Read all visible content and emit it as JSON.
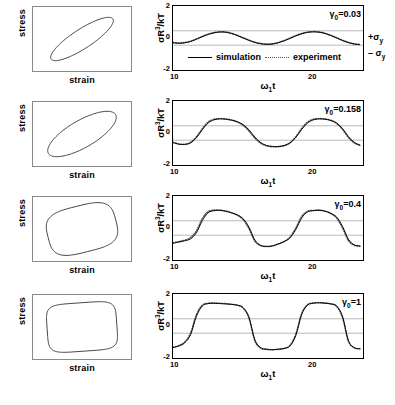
{
  "figure": {
    "rows": 4
  },
  "left_panels": {
    "xlabel": "strain",
    "ylabel": "stress",
    "shapes": [
      "narrow-tilted-ellipse",
      "wide-tilted-ellipse",
      "rounded-parallelogram",
      "rounded-rectangle"
    ]
  },
  "right_panels": {
    "ylabel_html": "σR<sup>3</sup>/kT",
    "xlabel_html": "ω<sub>1</sub>t",
    "yticks": [
      "2",
      "0",
      "-2"
    ],
    "xticks": [
      "10",
      "20"
    ],
    "sigma_plus": "+σ",
    "sigma_plus_sub": "y",
    "sigma_minus": "– σ",
    "sigma_minus_sub": "y",
    "legend": {
      "simulation": "simulation",
      "experiment": "experiment"
    }
  },
  "annotations": {
    "row1_gamma_pre": "γ",
    "row1_gamma_sub": "0",
    "row1_gamma_val": "=0.03",
    "row2_gamma_pre": "γ",
    "row2_gamma_sub": "0",
    "row2_gamma_val": "=0.158",
    "row3_gamma_pre": "γ",
    "row3_gamma_sub": "0",
    "row3_gamma_val": "=0.4",
    "row4_gamma_pre": "γ",
    "row4_gamma_sub": "0",
    "row4_gamma_val": "=1"
  },
  "chart_data": [
    {
      "type": "line",
      "panel": "row1-waveform",
      "title": "",
      "xlabel": "ω₁t",
      "ylabel": "σR³/kT",
      "xlim": [
        10,
        23
      ],
      "ylim": [
        -2,
        2
      ],
      "xticks": [
        10,
        20
      ],
      "yticks": [
        -2,
        0,
        2
      ],
      "grid": false,
      "gamma_0": 0.03,
      "reference_lines": [
        {
          "label": "+σy",
          "value": 0.45
        },
        {
          "label": "-σy",
          "value": -0.45
        }
      ],
      "legend": [
        "simulation",
        "experiment"
      ],
      "legend_position": "lower-left-inside",
      "series": [
        {
          "name": "simulation",
          "style": "solid",
          "x": [
            10.0,
            10.4,
            10.8,
            11.2,
            11.6,
            12.0,
            12.4,
            12.8,
            13.2,
            13.6,
            14.0,
            14.4,
            14.8,
            15.2,
            15.6,
            16.0,
            16.4,
            16.8,
            17.2,
            17.6,
            18.0,
            18.4,
            18.8,
            19.2,
            19.6,
            20.0,
            20.4,
            20.8,
            21.2,
            21.6,
            22.0,
            22.4,
            22.8
          ],
          "y": [
            -0.3,
            -0.33,
            -0.3,
            -0.22,
            -0.08,
            0.08,
            0.22,
            0.32,
            0.37,
            0.36,
            0.28,
            0.15,
            0.0,
            -0.15,
            -0.28,
            -0.36,
            -0.4,
            -0.38,
            -0.3,
            -0.18,
            -0.03,
            0.13,
            0.26,
            0.35,
            0.38,
            0.36,
            0.28,
            0.15,
            0.0,
            -0.16,
            -0.29,
            -0.38,
            -0.42
          ]
        },
        {
          "name": "experiment",
          "style": "dotted",
          "x": [
            10.0,
            10.4,
            10.8,
            11.2,
            11.6,
            12.0,
            12.4,
            12.8,
            13.2,
            13.6,
            14.0,
            14.4,
            14.8,
            15.2,
            15.6,
            16.0,
            16.4,
            16.8,
            17.2,
            17.6,
            18.0,
            18.4,
            18.8,
            19.2,
            19.6,
            20.0,
            20.4,
            20.8,
            21.2,
            21.6,
            22.0,
            22.4,
            22.8
          ],
          "y": [
            -0.28,
            -0.31,
            -0.28,
            -0.2,
            -0.06,
            0.1,
            0.24,
            0.34,
            0.39,
            0.38,
            0.3,
            0.17,
            0.02,
            -0.13,
            -0.26,
            -0.34,
            -0.38,
            -0.36,
            -0.28,
            -0.16,
            -0.01,
            0.15,
            0.28,
            0.37,
            0.4,
            0.38,
            0.3,
            0.17,
            0.02,
            -0.14,
            -0.27,
            -0.36,
            -0.4
          ]
        }
      ]
    },
    {
      "type": "line",
      "panel": "row2-waveform",
      "xlabel": "ω₁t",
      "ylabel": "σR³/kT",
      "xlim": [
        10,
        23
      ],
      "ylim": [
        -2,
        2
      ],
      "xticks": [
        10,
        20
      ],
      "yticks": [
        -2,
        0,
        2
      ],
      "gamma_0": 0.158,
      "reference_lines": [
        {
          "label": "+σy",
          "value": 0.45
        },
        {
          "label": "-σy",
          "value": -0.45
        }
      ],
      "series": [
        {
          "name": "simulation",
          "style": "solid",
          "x": [
            10.0,
            10.4,
            10.8,
            11.2,
            11.6,
            12.0,
            12.4,
            12.8,
            13.2,
            13.6,
            14.0,
            14.4,
            14.8,
            15.2,
            15.6,
            16.0,
            16.4,
            16.8,
            17.2,
            17.6,
            18.0,
            18.4,
            18.8,
            19.2,
            19.6,
            20.0,
            20.4,
            20.8,
            21.2,
            21.6,
            22.0,
            22.4,
            22.8
          ],
          "y": [
            -0.6,
            -0.7,
            -0.72,
            -0.62,
            -0.3,
            0.2,
            0.62,
            0.82,
            0.88,
            0.86,
            0.8,
            0.7,
            0.52,
            0.2,
            -0.25,
            -0.6,
            -0.78,
            -0.84,
            -0.84,
            -0.78,
            -0.62,
            -0.28,
            0.22,
            0.62,
            0.82,
            0.88,
            0.86,
            0.78,
            0.62,
            0.28,
            -0.22,
            -0.58,
            -0.76
          ]
        },
        {
          "name": "experiment",
          "style": "dotted",
          "x": [
            10.0,
            10.4,
            10.8,
            11.2,
            11.6,
            12.0,
            12.4,
            12.8,
            13.2,
            13.6,
            14.0,
            14.4,
            14.8,
            15.2,
            15.6,
            16.0,
            16.4,
            16.8,
            17.2,
            17.6,
            18.0,
            18.4,
            18.8,
            19.2,
            19.6,
            20.0,
            20.4,
            20.8,
            21.2,
            21.6,
            22.0,
            22.4,
            22.8
          ],
          "y": [
            -0.58,
            -0.68,
            -0.7,
            -0.58,
            -0.24,
            0.26,
            0.68,
            0.86,
            0.9,
            0.88,
            0.82,
            0.7,
            0.48,
            0.12,
            -0.32,
            -0.64,
            -0.8,
            -0.86,
            -0.86,
            -0.8,
            -0.62,
            -0.24,
            0.28,
            0.68,
            0.86,
            0.9,
            0.88,
            0.8,
            0.6,
            0.22,
            -0.28,
            -0.62,
            -0.78
          ]
        }
      ]
    },
    {
      "type": "line",
      "panel": "row3-waveform",
      "xlabel": "ω₁t",
      "ylabel": "σR³/kT",
      "xlim": [
        10,
        23
      ],
      "ylim": [
        -2,
        2
      ],
      "xticks": [
        10,
        20
      ],
      "yticks": [
        -2,
        0,
        2
      ],
      "gamma_0": 0.4,
      "reference_lines": [
        {
          "label": "+σy",
          "value": 0.45
        },
        {
          "label": "-σy",
          "value": -0.45
        }
      ],
      "series": [
        {
          "name": "simulation",
          "style": "solid",
          "x": [
            10.0,
            10.4,
            10.8,
            11.2,
            11.6,
            12.0,
            12.4,
            12.8,
            13.2,
            13.6,
            14.0,
            14.4,
            14.8,
            15.2,
            15.6,
            16.0,
            16.4,
            16.8,
            17.2,
            17.6,
            18.0,
            18.4,
            18.8,
            19.2,
            19.6,
            20.0,
            20.4,
            20.8,
            21.2,
            21.6,
            22.0,
            22.4,
            22.8
          ],
          "y": [
            -0.95,
            -0.88,
            -0.8,
            -0.68,
            -0.3,
            0.45,
            0.95,
            1.08,
            1.1,
            1.05,
            0.95,
            0.82,
            0.58,
            0.05,
            -0.75,
            -1.08,
            -1.15,
            -1.12,
            -1.0,
            -0.85,
            -0.62,
            -0.1,
            0.62,
            1.0,
            1.08,
            1.1,
            1.05,
            0.92,
            0.68,
            0.1,
            -0.7,
            -1.05,
            -1.12
          ]
        },
        {
          "name": "experiment",
          "style": "dotted",
          "x": [
            10.0,
            10.4,
            10.8,
            11.2,
            11.6,
            12.0,
            12.4,
            12.8,
            13.2,
            13.6,
            14.0,
            14.4,
            14.8,
            15.2,
            15.6,
            16.0,
            16.4,
            16.8,
            17.2,
            17.6,
            18.0,
            18.4,
            18.8,
            19.2,
            19.6,
            20.0,
            20.4,
            20.8,
            21.2,
            21.6,
            22.0,
            22.4,
            22.8
          ],
          "y": [
            -0.92,
            -0.85,
            -0.76,
            -0.6,
            -0.18,
            0.58,
            1.02,
            1.12,
            1.12,
            1.06,
            0.95,
            0.8,
            0.52,
            -0.05,
            -0.82,
            -1.1,
            -1.16,
            -1.12,
            -1.0,
            -0.84,
            -0.58,
            0.0,
            0.72,
            1.04,
            1.1,
            1.12,
            1.06,
            0.9,
            0.62,
            0.0,
            -0.78,
            -1.08,
            -1.14
          ]
        }
      ]
    },
    {
      "type": "line",
      "panel": "row4-waveform",
      "xlabel": "ω₁t",
      "ylabel": "σR³/kT",
      "xlim": [
        10,
        23
      ],
      "ylim": [
        -2,
        2
      ],
      "xticks": [
        10,
        20
      ],
      "yticks": [
        -2,
        0,
        2
      ],
      "gamma_0": 1,
      "reference_lines": [
        {
          "label": "+σy",
          "value": 0.45
        },
        {
          "label": "-σy",
          "value": -0.45
        }
      ],
      "series": [
        {
          "name": "simulation",
          "style": "solid",
          "x": [
            10.0,
            10.4,
            10.8,
            11.2,
            11.6,
            12.0,
            12.4,
            12.8,
            13.2,
            13.6,
            14.0,
            14.4,
            14.8,
            15.2,
            15.6,
            16.0,
            16.4,
            16.8,
            17.2,
            17.6,
            18.0,
            18.4,
            18.8,
            19.2,
            19.6,
            20.0,
            20.4,
            20.8,
            21.2,
            21.6,
            22.0,
            22.4,
            22.8
          ],
          "y": [
            -1.35,
            -1.25,
            -1.05,
            -0.55,
            0.6,
            1.25,
            1.4,
            1.42,
            1.4,
            1.38,
            1.35,
            1.3,
            1.15,
            0.55,
            -0.85,
            -1.35,
            -1.45,
            -1.48,
            -1.45,
            -1.4,
            -1.25,
            -0.6,
            0.7,
            1.3,
            1.42,
            1.45,
            1.42,
            1.38,
            1.25,
            0.6,
            -0.9,
            -1.35,
            -1.42
          ]
        },
        {
          "name": "experiment",
          "style": "dotted",
          "x": [
            10.0,
            10.4,
            10.8,
            11.2,
            11.6,
            12.0,
            12.4,
            12.8,
            13.2,
            13.6,
            14.0,
            14.4,
            14.8,
            15.2,
            15.6,
            16.0,
            16.4,
            16.8,
            17.2,
            17.6,
            18.0,
            18.4,
            18.8,
            19.2,
            19.6,
            20.0,
            20.4,
            20.8,
            21.2,
            21.6,
            22.0,
            22.4,
            22.8
          ],
          "y": [
            -1.33,
            -1.22,
            -1.0,
            -0.45,
            0.7,
            1.3,
            1.42,
            1.44,
            1.42,
            1.4,
            1.36,
            1.3,
            1.12,
            0.48,
            -0.92,
            -1.38,
            -1.46,
            -1.48,
            -1.46,
            -1.4,
            -1.22,
            -0.52,
            0.78,
            1.33,
            1.44,
            1.46,
            1.44,
            1.38,
            1.22,
            0.52,
            -0.95,
            -1.36,
            -1.43
          ]
        }
      ]
    },
    {
      "type": "line",
      "panel": "row1-lissajous",
      "xlabel": "strain",
      "ylabel": "stress",
      "shape": "narrow tilted ellipse",
      "description": "elastic-dominated narrow ellipse tilted ~40 degrees"
    },
    {
      "type": "line",
      "panel": "row2-lissajous",
      "xlabel": "strain",
      "ylabel": "stress",
      "shape": "wide tilted ellipse",
      "description": "broader ellipse, increased loop area"
    },
    {
      "type": "line",
      "panel": "row3-lissajous",
      "xlabel": "strain",
      "ylabel": "stress",
      "shape": "rounded parallelogram",
      "description": "distorted non-elliptical loop, yielding onset"
    },
    {
      "type": "line",
      "panel": "row4-lissajous",
      "xlabel": "strain",
      "ylabel": "stress",
      "shape": "rounded rectangle",
      "description": "plastic plateau, near-rectangular loop"
    }
  ]
}
